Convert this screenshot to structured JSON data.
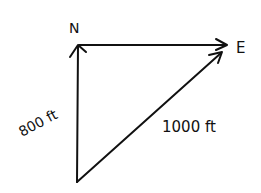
{
  "diagram": {
    "type": "vector-triangle",
    "labels": {
      "north": "N",
      "east": "E",
      "north_leg": "800 ft",
      "resultant": "1000 ft"
    },
    "colors": {
      "ink": "#111111",
      "background": "#ffffff"
    }
  }
}
